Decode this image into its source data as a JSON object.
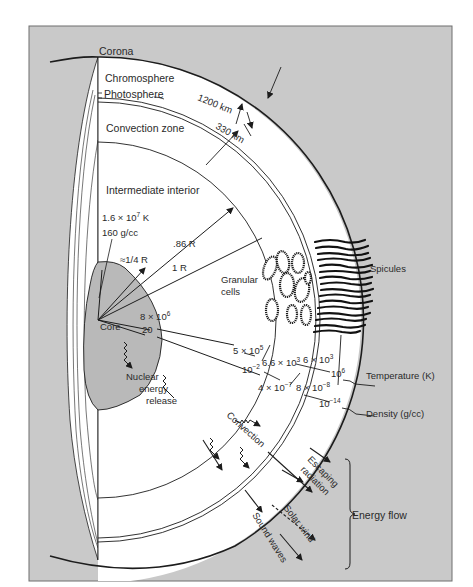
{
  "figure": {
    "colors": {
      "page_background": "#ffffff",
      "panel_background": "#c9c9c9",
      "panel_border": "#6e6e6e",
      "interior": "#ffffff",
      "core": "#b9b9b9",
      "line": "#1c1c1c",
      "text": "#2a2a2a"
    }
  },
  "layers": {
    "corona": "Corona",
    "chromosphere": "Chromosphere",
    "photosphere": "Photosphere",
    "convection_zone": "Convection zone",
    "intermediate_interior": "Intermediate interior",
    "core": "Core"
  },
  "dimensions": {
    "chromosphere_thickness": "1200 km",
    "photosphere_thickness": "330 km"
  },
  "radii": {
    "core_radius": "≈1/4 R",
    "convection_inner_radius": ".86 R",
    "surface_radius": "1 R"
  },
  "core_values": {
    "temperature": "1.6 × 10",
    "temperature_exp": "7",
    "temperature_unit": " K",
    "density": "160 g/cc"
  },
  "features": {
    "granular_cells_line1": "Granular",
    "granular_cells_line2": "cells",
    "spicules": "Spicules",
    "nuclear_line1": "Nuclear",
    "nuclear_line2": "energy",
    "nuclear_line3": "release",
    "convection": "Convection"
  },
  "temperature_values": [
    {
      "mantissa": "8 × 10",
      "exp": "6"
    },
    {
      "mantissa": "5 × 10",
      "exp": "5"
    },
    {
      "mantissa": "6.6 × 10",
      "exp": "3"
    },
    {
      "mantissa": "6 × 10",
      "exp": "3"
    },
    {
      "mantissa": "10",
      "exp": "6"
    }
  ],
  "density_values": [
    {
      "mantissa": "20",
      "exp": ""
    },
    {
      "mantissa": "10",
      "exp": "−2"
    },
    {
      "mantissa": "4 × 10",
      "exp": "−7"
    },
    {
      "mantissa": "8 × 10",
      "exp": "−8"
    },
    {
      "mantissa": "10",
      "exp": "−14"
    }
  ],
  "legend": {
    "temperature": "Temperature (K)",
    "density": "Density (g/cc)"
  },
  "energy_flow": {
    "label": "Energy flow",
    "escaping_line1": "Escaping",
    "escaping_line2": "radiation",
    "solar_wind": "Solar wind",
    "sound_waves": "Sound waves"
  }
}
